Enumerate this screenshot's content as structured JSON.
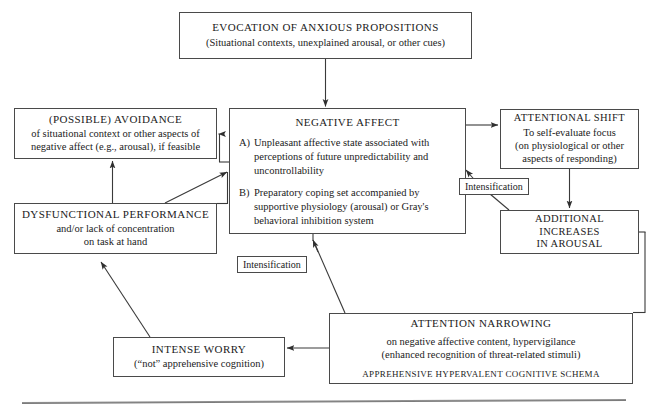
{
  "diagram": {
    "boxes": {
      "evocation": {
        "title": "EVOCATION OF ANXIOUS PROPOSITIONS",
        "subtitle": "(Situational contexts, unexplained arousal, or other cues)"
      },
      "negative_affect": {
        "title": "NEGATIVE AFFECT",
        "items": [
          {
            "letter": "A)",
            "text": "Unpleasant affective state associated with perceptions of future unpredictability and uncontrollability"
          },
          {
            "letter": "B)",
            "text": "Preparatory coping set accompanied by supportive physiology (arousal) or Gray's behavioral inhibition system"
          }
        ]
      },
      "avoidance": {
        "title": "(POSSIBLE) AVOIDANCE",
        "line1": "of situational context or other aspects of",
        "line2": "negative affect (e.g., arousal), if feasible"
      },
      "dysfunctional_performance": {
        "title": "DYSFUNCTIONAL PERFORMANCE",
        "line1": "and/or lack of concentration",
        "line2": "on task at hand"
      },
      "attentional_shift": {
        "title": "ATTENTIONAL SHIFT",
        "line1": "To self-evaluate focus",
        "line2": "(on physiological or other",
        "line3": "aspects of responding)"
      },
      "additional_arousal": {
        "line1": "ADDITIONAL INCREASES",
        "line2": "IN AROUSAL"
      },
      "attention_narrowing": {
        "title": "ATTENTION NARROWING",
        "line1": "on negative affective content, hypervigilance",
        "line2": "(enhanced recognition of threat-related stimuli)",
        "schema": "APPREHENSIVE  HYPERVALENT  COGNITIVE  SCHEMA"
      },
      "intense_worry": {
        "title": "INTENSE WORRY",
        "subtitle": "(“not” apprehensive cognition)"
      }
    },
    "tags": {
      "intensification_right": "Intensification",
      "intensification_left": "Intensification"
    },
    "colors": {
      "box_border": "#4a4a4a",
      "arrow": "#3a3a3a",
      "text": "#1b1b1b",
      "background": "#ffffff"
    }
  }
}
